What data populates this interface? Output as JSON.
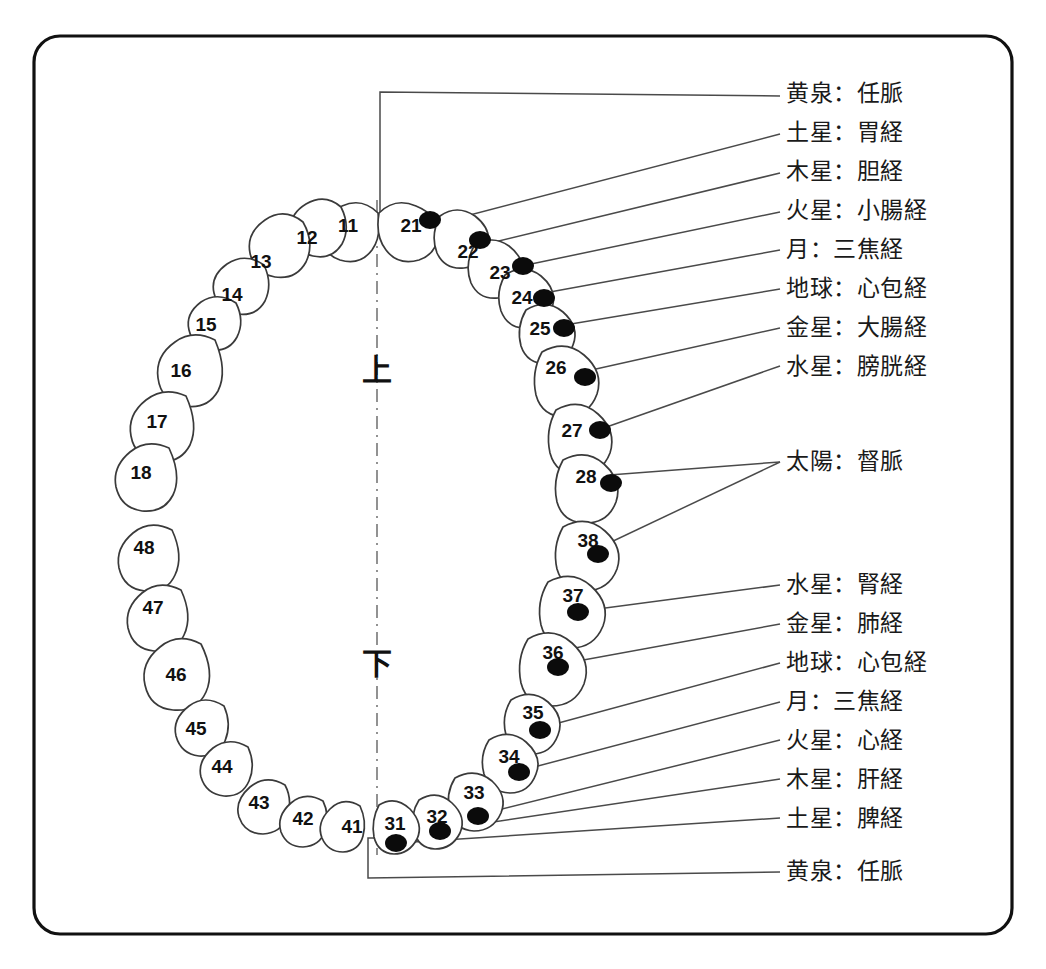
{
  "figure": {
    "axis_markers": {
      "upper": "上",
      "lower": "下"
    }
  },
  "quadrants": {
    "upper_left": {
      "name": "upper-left-quadrant",
      "teeth": [
        {
          "number": "11",
          "dot": false
        },
        {
          "number": "12",
          "dot": false
        },
        {
          "number": "13",
          "dot": false
        },
        {
          "number": "14",
          "dot": false
        },
        {
          "number": "15",
          "dot": false
        },
        {
          "number": "16",
          "dot": false
        },
        {
          "number": "17",
          "dot": false
        },
        {
          "number": "18",
          "dot": false
        }
      ]
    },
    "upper_right": {
      "name": "upper-right-quadrant",
      "teeth": [
        {
          "number": "21",
          "dot": true
        },
        {
          "number": "22",
          "dot": true
        },
        {
          "number": "23",
          "dot": true
        },
        {
          "number": "24",
          "dot": true
        },
        {
          "number": "25",
          "dot": true
        },
        {
          "number": "26",
          "dot": true
        },
        {
          "number": "27",
          "dot": true
        },
        {
          "number": "28",
          "dot": true
        }
      ]
    },
    "lower_right": {
      "name": "lower-right-quadrant",
      "teeth": [
        {
          "number": "31",
          "dot": true
        },
        {
          "number": "32",
          "dot": true
        },
        {
          "number": "33",
          "dot": true
        },
        {
          "number": "34",
          "dot": true
        },
        {
          "number": "35",
          "dot": true
        },
        {
          "number": "36",
          "dot": true
        },
        {
          "number": "37",
          "dot": true
        },
        {
          "number": "38",
          "dot": true
        }
      ]
    },
    "lower_left": {
      "name": "lower-left-quadrant",
      "teeth": [
        {
          "number": "41",
          "dot": false
        },
        {
          "number": "42",
          "dot": false
        },
        {
          "number": "43",
          "dot": false
        },
        {
          "number": "44",
          "dot": false
        },
        {
          "number": "45",
          "dot": false
        },
        {
          "number": "46",
          "dot": false
        },
        {
          "number": "47",
          "dot": false
        },
        {
          "number": "48",
          "dot": false
        }
      ]
    }
  },
  "labels_upper": [
    {
      "text": "黄泉：任脈",
      "planet": "黄泉",
      "meridian": "任脈",
      "tooth": "21"
    },
    {
      "text": "土星：胃経",
      "planet": "土星",
      "meridian": "胃経",
      "tooth": "22"
    },
    {
      "text": "木星：胆経",
      "planet": "木星",
      "meridian": "胆経",
      "tooth": "23"
    },
    {
      "text": "火星：小腸経",
      "planet": "火星",
      "meridian": "小腸経",
      "tooth": "24"
    },
    {
      "text": "月：三焦経",
      "planet": "月",
      "meridian": "三焦経",
      "tooth": "25"
    },
    {
      "text": "地球：心包経",
      "planet": "地球",
      "meridian": "心包経",
      "tooth": "26"
    },
    {
      "text": "金星：大腸経",
      "planet": "金星",
      "meridian": "大腸経",
      "tooth": "27"
    },
    {
      "text": "水星：膀胱経",
      "planet": "水星",
      "meridian": "膀胱経",
      "tooth": "28"
    }
  ],
  "labels_middle": [
    {
      "text": "太陽：督脈",
      "planet": "太陽",
      "meridian": "督脈",
      "tooth": "28, 38"
    }
  ],
  "labels_lower": [
    {
      "text": "水星：腎経",
      "planet": "水星",
      "meridian": "腎経",
      "tooth": "37"
    },
    {
      "text": "金星：肺経",
      "planet": "金星",
      "meridian": "肺経",
      "tooth": "36"
    },
    {
      "text": "地球：心包経",
      "planet": "地球",
      "meridian": "心包経",
      "tooth": "35"
    },
    {
      "text": "月：三焦経",
      "planet": "月",
      "meridian": "三焦経",
      "tooth": "34"
    },
    {
      "text": "火星：心経",
      "planet": "火星",
      "meridian": "心経",
      "tooth": "33"
    },
    {
      "text": "木星：肝経",
      "planet": "木星",
      "meridian": "肝経",
      "tooth": "32"
    },
    {
      "text": "土星：脾経",
      "planet": "土星",
      "meridian": "脾経",
      "tooth": "31"
    },
    {
      "text": "黄泉：任脈",
      "planet": "黄泉",
      "meridian": "任脈",
      "tooth": "31"
    }
  ],
  "colors": {
    "frame": "#111111",
    "tooth_outline": "#3a3a3a",
    "dot": "#0b0b0b",
    "leader": "#4a4a4a",
    "midline": "#777777",
    "background": "#ffffff"
  }
}
